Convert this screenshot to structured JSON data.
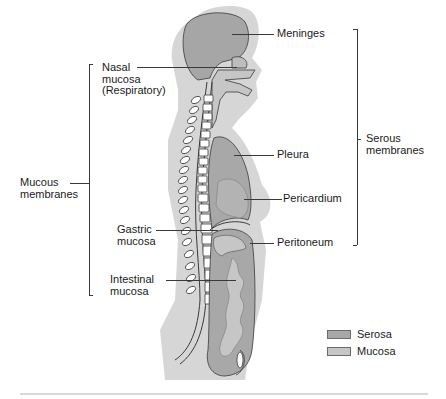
{
  "diagram": {
    "type": "anatomical-sagittal-section",
    "colors": {
      "body_outline_fill": "#d4d4d4",
      "serosa": "#a8a8a8",
      "mucosa": "#c6c6c6",
      "line": "#3a3a3a"
    },
    "labels": {
      "meninges": "Meninges",
      "nasal_mucosa": "Nasal\nmucosa\n(Respiratory)",
      "pleura": "Pleura",
      "pericardium": "Pericardium",
      "peritoneum": "Peritoneum",
      "gastric_mucosa": "Gastric\nmucosa",
      "intestinal_mucosa": "Intestinal\nmucosa",
      "mucous_membranes": "Mucous\nmembranes",
      "serous_membranes": "Serous\nmembranes"
    },
    "legend": [
      {
        "label": "Serosa",
        "color": "#a8a8a8"
      },
      {
        "label": "Mucosa",
        "color": "#c6c6c6"
      }
    ]
  }
}
